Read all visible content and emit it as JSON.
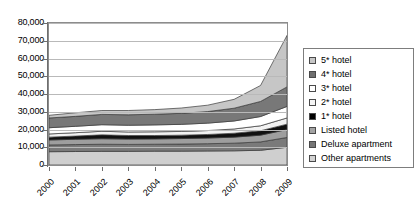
{
  "chart_data": {
    "type": "area",
    "stacked": true,
    "title": "",
    "subtitle": "",
    "xlabel": "",
    "ylabel": "",
    "categories": [
      "2000",
      "2001",
      "2002",
      "2003",
      "2004",
      "2005",
      "2006",
      "2007",
      "2008",
      "2009"
    ],
    "ylim": [
      0,
      80000
    ],
    "ytick_values": [
      0,
      10000,
      20000,
      30000,
      40000,
      50000,
      60000,
      70000,
      80000
    ],
    "ytick_labels": [
      "0",
      "10,000",
      "20,000",
      "30,000",
      "40,000",
      "50,000",
      "60,000",
      "70,000",
      "80,000"
    ],
    "grid": true,
    "legend_position": "right",
    "series": [
      {
        "name": "5* hotel",
        "color": "#c6c6c6",
        "values": [
          1500,
          2000,
          2200,
          2400,
          2600,
          3000,
          3600,
          5000,
          9000,
          29000
        ]
      },
      {
        "name": "4* hotel",
        "color": "#787878",
        "values": [
          5500,
          5600,
          5800,
          5900,
          6000,
          6200,
          6500,
          7200,
          8500,
          11000
        ]
      },
      {
        "name": "3* hotel",
        "color": "#ffffff",
        "values": [
          3500,
          3600,
          3700,
          3800,
          3900,
          4000,
          4200,
          4500,
          5200,
          6500
        ]
      },
      {
        "name": "2* hotel",
        "color": "#f2f2f2",
        "values": [
          1800,
          1900,
          2000,
          2000,
          2100,
          2100,
          2200,
          2400,
          2800,
          3500
        ]
      },
      {
        "name": "1* hotel",
        "color": "#111111",
        "values": [
          1600,
          1800,
          2200,
          2000,
          1900,
          1900,
          2000,
          2200,
          2500,
          3000
        ]
      },
      {
        "name": "Listed hotel",
        "color": "#9e9e9e",
        "values": [
          2800,
          3000,
          3100,
          3000,
          3000,
          3100,
          3200,
          3400,
          3800,
          4500
        ]
      },
      {
        "name": "Deluxe apartment",
        "color": "#7a7a7a",
        "values": [
          3800,
          3900,
          4000,
          3900,
          3900,
          4000,
          4100,
          4300,
          4700,
          5500
        ]
      },
      {
        "name": "Other apartments",
        "color": "#cfcfcf",
        "values": [
          7500,
          7600,
          7700,
          7700,
          7800,
          7800,
          7900,
          8000,
          8300,
          10000
        ]
      }
    ],
    "totals": [
      28000,
      29400,
      30700,
      30700,
      31200,
      32100,
      33700,
      37000,
      44800,
      73000
    ]
  },
  "legend": {
    "items": [
      {
        "label": "5* hotel",
        "swatch": "#c6c6c6"
      },
      {
        "label": "4* hotel",
        "swatch": "#6f6f6f"
      },
      {
        "label": "3* hotel",
        "swatch": "#ffffff"
      },
      {
        "label": "2* hotel",
        "swatch": "#f5f5f5"
      },
      {
        "label": "1* hotel",
        "swatch": "#000000"
      },
      {
        "label": "Listed hotel",
        "swatch": "#a3a3a3"
      },
      {
        "label": "Deluxe apartment",
        "swatch": "#767676"
      },
      {
        "label": "Other apartments",
        "swatch": "#d2d2d2"
      }
    ]
  }
}
